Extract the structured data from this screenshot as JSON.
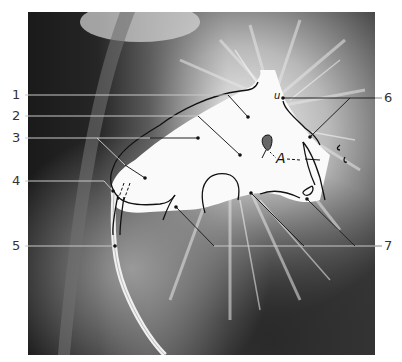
{
  "figure": {
    "type": "annotated angiogram radiograph",
    "colors": {
      "background": "#ffffff",
      "film_dark": "#1e1e1e",
      "contrast_white": "#f7f7f7",
      "leader_line_on_dark": "#c8c8c8",
      "leader_line_on_light": "#222222",
      "outline": "#111111",
      "label_text": "#333333"
    },
    "labels": [
      {
        "id": "1",
        "text": "1",
        "side": "left"
      },
      {
        "id": "2",
        "text": "2",
        "side": "left"
      },
      {
        "id": "3",
        "text": "3",
        "side": "left"
      },
      {
        "id": "4",
        "text": "4",
        "side": "left"
      },
      {
        "id": "5",
        "text": "5",
        "side": "left"
      },
      {
        "id": "6",
        "text": "6",
        "side": "right"
      },
      {
        "id": "7",
        "text": "7",
        "side": "right"
      }
    ],
    "sketch_annotations": {
      "u": "u",
      "A": "A"
    }
  }
}
